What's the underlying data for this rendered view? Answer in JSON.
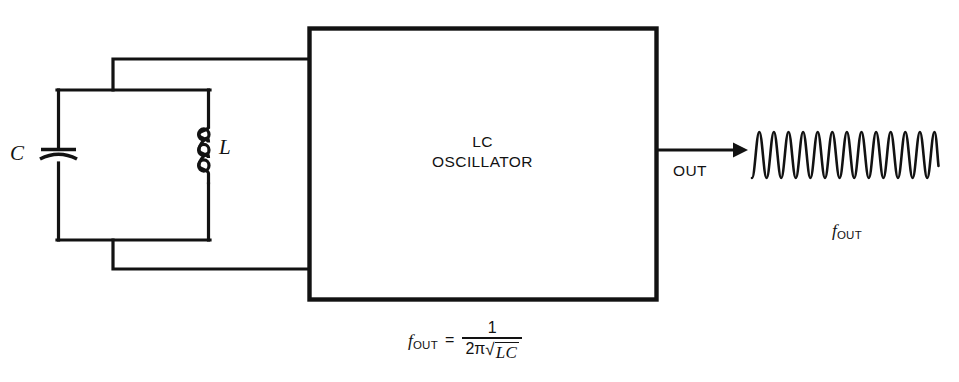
{
  "diagram": {
    "stroke_color": "#121212",
    "background_color": "#ffffff",
    "block": {
      "line1": "LC",
      "line2": "OSCILLATOR"
    },
    "components": {
      "capacitor_label": "C",
      "inductor_label": "L",
      "inductor_loops": 3
    },
    "output": {
      "arrow_label": "OUT",
      "waveform_label_symbol": "f",
      "waveform_label_subscript": "OUT",
      "waveform_cycles": 16
    },
    "formula": {
      "lhs_symbol": "f",
      "lhs_subscript": "OUT",
      "equals": "=",
      "numerator": "1",
      "denominator_prefix": "2π",
      "radical_sign": "√",
      "radicand": "LC"
    }
  }
}
